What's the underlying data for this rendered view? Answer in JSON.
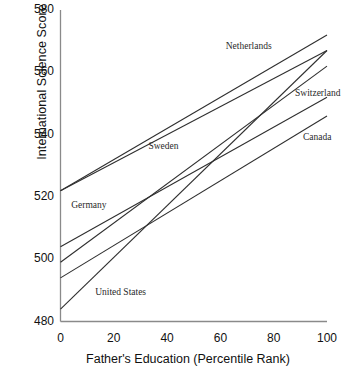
{
  "chart_data": {
    "type": "line",
    "title": "",
    "xlabel": "Father's Education (Percentile Rank)",
    "ylabel": "International Science Score",
    "xlim": [
      0,
      100
    ],
    "ylim": [
      480,
      580
    ],
    "xticks": [
      "0",
      "20",
      "40",
      "60",
      "80",
      "100"
    ],
    "xtick_values": [
      0,
      20,
      40,
      60,
      80,
      100
    ],
    "yticks": [
      "480",
      "500",
      "520",
      "540",
      "560",
      "580"
    ],
    "ytick_values": [
      480,
      500,
      520,
      540,
      560,
      580
    ],
    "grid": false,
    "legend": "inline-annotations",
    "x": [
      0,
      100
    ],
    "series": [
      {
        "name": "Netherlands",
        "values": [
          522,
          572
        ]
      },
      {
        "name": "Sweden",
        "values": [
          522,
          567
        ]
      },
      {
        "name": "United States",
        "values": [
          484,
          567
        ]
      },
      {
        "name": "Switzerland",
        "values": [
          499,
          562
        ]
      },
      {
        "name": "Germany",
        "values": [
          504,
          552
        ]
      },
      {
        "name": "Canada",
        "values": [
          494,
          546
        ]
      }
    ],
    "annotations": [
      {
        "text": "Netherlands",
        "x": 62,
        "y": 568
      },
      {
        "text": "Switzerland",
        "x": 88,
        "y": 553
      },
      {
        "text": "Canada",
        "x": 91,
        "y": 539
      },
      {
        "text": "Sweden",
        "x": 33,
        "y": 536
      },
      {
        "text": "Germany",
        "x": 4,
        "y": 517
      },
      {
        "text": "United States",
        "x": 13,
        "y": 489
      }
    ]
  },
  "axes": {
    "line_color": "#8a8a8a",
    "series_color": "#2f2f2f"
  }
}
